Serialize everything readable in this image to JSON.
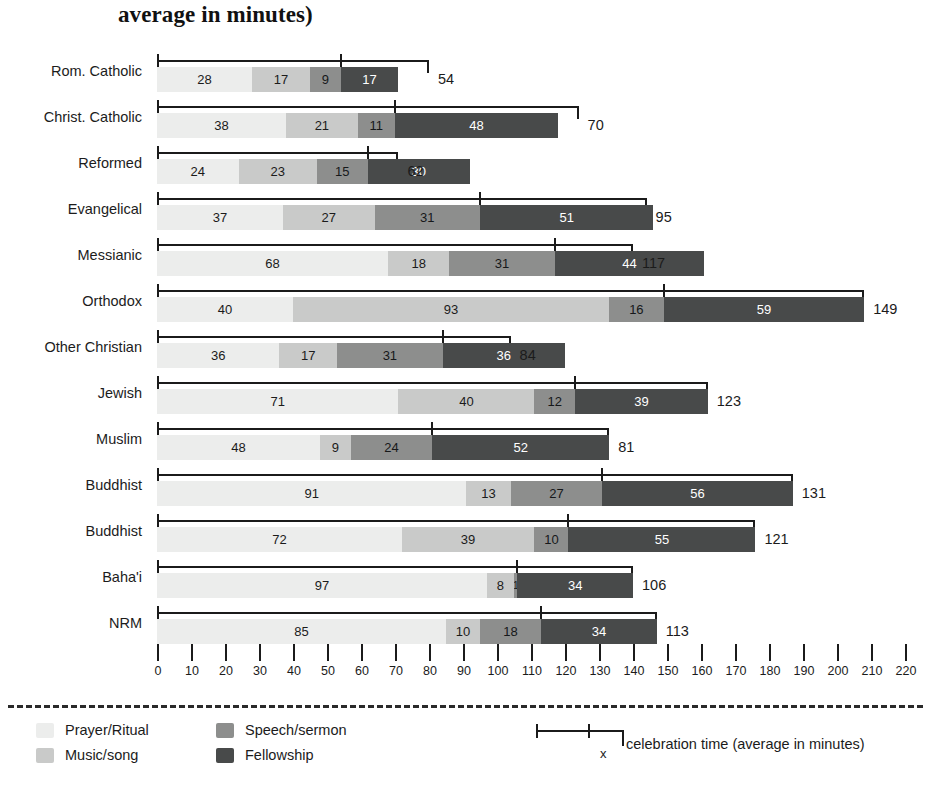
{
  "title": "average in minutes)",
  "chart_data": {
    "type": "bar",
    "orientation": "horizontal",
    "stacked": true,
    "title": "average in minutes)",
    "xlabel": "celebration time (average in minutes)",
    "ylabel": "",
    "xlim": [
      0,
      220
    ],
    "xtick_step": 10,
    "grid": false,
    "legend_position": "bottom-left",
    "series": [
      {
        "name": "Prayer/Ritual",
        "color": "#ecedec",
        "values": [
          28,
          38,
          24,
          37,
          68,
          40,
          36,
          71,
          48,
          91,
          72,
          97,
          85
        ]
      },
      {
        "name": "Music/song",
        "color": "#c9cac9",
        "values": [
          17,
          21,
          23,
          27,
          18,
          93,
          17,
          40,
          9,
          13,
          39,
          8,
          10
        ]
      },
      {
        "name": "Speech/sermon",
        "color": "#8d8e8d",
        "values": [
          9,
          11,
          15,
          31,
          31,
          16,
          31,
          12,
          24,
          27,
          10,
          1,
          18
        ]
      },
      {
        "name": "Fellowship",
        "color": "#484a4a",
        "values": [
          17,
          48,
          30,
          51,
          44,
          59,
          36,
          39,
          52,
          56,
          55,
          34,
          34
        ]
      }
    ],
    "categories": [
      "Rom. Catholic",
      "Christ. Catholic",
      "Reformed",
      "Evangelical",
      "Messianic",
      "Orthodox",
      "Other Christian",
      "Jewish",
      "Muslim",
      "Buddhist",
      "Buddhist",
      "Baha'i",
      "NRM"
    ],
    "celebration_time": [
      54,
      70,
      62,
      95,
      117,
      149,
      84,
      123,
      81,
      131,
      121,
      106,
      113
    ],
    "bracket_end": [
      80,
      124,
      71,
      144,
      140,
      208,
      104,
      162,
      133,
      187,
      176,
      140,
      147
    ],
    "xticks": [
      0,
      10,
      20,
      30,
      40,
      50,
      60,
      70,
      80,
      90,
      100,
      110,
      120,
      130,
      140,
      150,
      160,
      170,
      180,
      190,
      200,
      210,
      220
    ]
  },
  "rows": [
    {
      "label": "Rom. Catholic",
      "segments": [
        28,
        17,
        9,
        17
      ],
      "total": 54
    },
    {
      "label": "Christ. Catholic",
      "segments": [
        38,
        21,
        11,
        48
      ],
      "total": 70
    },
    {
      "label": "Reformed",
      "segments": [
        24,
        23,
        15,
        30
      ],
      "total": 62
    },
    {
      "label": "Evangelical",
      "segments": [
        37,
        27,
        31,
        51
      ],
      "total": 95
    },
    {
      "label": "Messianic",
      "segments": [
        68,
        18,
        31,
        44
      ],
      "total": 117
    },
    {
      "label": "Orthodox",
      "segments": [
        40,
        93,
        16,
        59
      ],
      "total": 149
    },
    {
      "label": "Other Christian",
      "segments": [
        36,
        17,
        31,
        36
      ],
      "total": 84
    },
    {
      "label": "Jewish",
      "segments": [
        71,
        40,
        12,
        39
      ],
      "total": 123
    },
    {
      "label": "Muslim",
      "segments": [
        48,
        9,
        24,
        52
      ],
      "total": 81
    },
    {
      "label": "Buddhist",
      "segments": [
        91,
        13,
        27,
        56
      ],
      "total": 131
    },
    {
      "label": "Buddhist",
      "segments": [
        72,
        39,
        10,
        55
      ],
      "total": 121
    },
    {
      "label": "Baha'i",
      "segments": [
        97,
        8,
        1,
        34
      ],
      "total": 106
    },
    {
      "label": "NRM",
      "segments": [
        85,
        10,
        18,
        34
      ],
      "total": 113
    }
  ],
  "axis": {
    "ticks": [
      "0",
      "10",
      "20",
      "30",
      "40",
      "50",
      "60",
      "70",
      "80",
      "90",
      "100",
      "110",
      "120",
      "130",
      "140",
      "150",
      "160",
      "170",
      "180",
      "190",
      "200",
      "210",
      "220"
    ]
  },
  "legend": {
    "items": [
      {
        "label": "Prayer/Ritual",
        "color": "#ecedec"
      },
      {
        "label": "Music/song",
        "color": "#c9cac9"
      },
      {
        "label": "Speech/sermon",
        "color": "#8d8e8d"
      },
      {
        "label": "Fellowship",
        "color": "#484a4a"
      }
    ],
    "marker_label": "x",
    "caption": "celebration time (average in minutes)"
  }
}
